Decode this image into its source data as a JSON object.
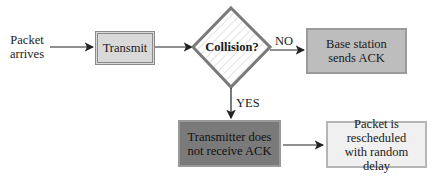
{
  "diagram": {
    "type": "flowchart",
    "start_label": [
      "Packet",
      "arrives"
    ],
    "nodes": {
      "transmit": "Transmit",
      "collision": "Collision?",
      "base_station": "Base station sends ACK",
      "not_receive": "Transmitter does not receive ACK",
      "rescheduled": "Packet is rescheduled with random delay"
    },
    "edge_labels": {
      "no": "NO",
      "yes": "YES"
    },
    "colors": {
      "transmit_fill": "#d9d9d9",
      "diamond_border": "#7a7a7a",
      "base_fill": "#bdbdbd",
      "not_receive_fill": "#7a7a7a",
      "rescheduled_fill": "#f0f0f0"
    }
  }
}
